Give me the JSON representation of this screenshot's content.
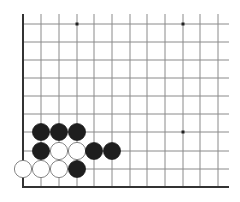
{
  "board": {
    "description": "Go board corner diagram (lower-left corner)",
    "grid": {
      "x_lines": [
        23,
        41,
        59,
        77,
        94,
        112,
        130,
        147,
        165,
        183,
        200,
        218
      ],
      "y_lines": [
        24,
        42,
        60,
        78,
        96,
        114,
        132,
        151,
        169
      ],
      "right_extent": 229,
      "top_extent": 14,
      "left_border_x": 23,
      "bottom_border_y": 187
    },
    "colors": {
      "line": "#8a8a8a",
      "border": "#333333",
      "black_stone": "#1e1e1e",
      "white_stone": "#ffffff",
      "white_stone_edge": "#777777",
      "hoshi": "#222222"
    },
    "hoshi": [
      {
        "col": 3,
        "row": 0
      },
      {
        "col": 9,
        "row": 0
      },
      {
        "col": 9,
        "row": 6
      }
    ],
    "stones": [
      {
        "color": "black",
        "col": 1,
        "row": 6
      },
      {
        "color": "black",
        "col": 2,
        "row": 6
      },
      {
        "color": "black",
        "col": 3,
        "row": 6
      },
      {
        "color": "black",
        "col": 1,
        "row": 7
      },
      {
        "color": "white",
        "col": 2,
        "row": 7
      },
      {
        "color": "white",
        "col": 3,
        "row": 7
      },
      {
        "color": "black",
        "col": 4,
        "row": 7
      },
      {
        "color": "black",
        "col": 5,
        "row": 7
      },
      {
        "color": "white",
        "col": 0,
        "row": 8
      },
      {
        "color": "white",
        "col": 1,
        "row": 8
      },
      {
        "color": "white",
        "col": 2,
        "row": 8
      },
      {
        "color": "black",
        "col": 3,
        "row": 8
      }
    ]
  }
}
